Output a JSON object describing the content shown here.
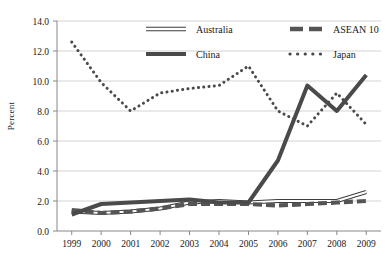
{
  "chart_data": {
    "type": "line",
    "title": "",
    "xlabel": "",
    "ylabel": "Percent",
    "x": [
      1999,
      2000,
      2001,
      2002,
      2003,
      2004,
      2005,
      2006,
      2007,
      2008,
      2009
    ],
    "categories": [
      "1999",
      "2000",
      "2001",
      "2002",
      "2003",
      "2004",
      "2005",
      "2006",
      "2007",
      "2008",
      "2009"
    ],
    "ylim": [
      0.0,
      14.0
    ],
    "yticks": [
      0.0,
      2.0,
      4.0,
      6.0,
      8.0,
      10.0,
      12.0,
      14.0
    ],
    "ytick_labels": [
      "0.0",
      "2.0",
      "4.0",
      "6.0",
      "8.0",
      "10.0",
      "12.0",
      "14.0"
    ],
    "grid": true,
    "legend_position": "top",
    "series": [
      {
        "name": "Australia",
        "style": "thin-outline",
        "color": "#3d3d3d",
        "values": [
          1.3,
          1.2,
          1.3,
          1.5,
          1.9,
          2.0,
          1.9,
          2.0,
          2.0,
          2.0,
          2.6
        ]
      },
      {
        "name": "ASEAN 10",
        "style": "dashed",
        "color": "#555555",
        "values": [
          1.4,
          1.2,
          1.3,
          1.5,
          1.8,
          1.8,
          1.8,
          1.7,
          1.8,
          1.9,
          2.0
        ]
      },
      {
        "name": "China",
        "style": "solid",
        "color": "#4a4a4a",
        "values": [
          1.1,
          1.8,
          1.9,
          2.0,
          2.1,
          1.9,
          1.9,
          4.7,
          9.7,
          8.0,
          10.4
        ]
      },
      {
        "name": "Japan",
        "style": "dotted",
        "color": "#4a4a4a",
        "values": [
          12.6,
          9.9,
          8.0,
          9.2,
          9.5,
          9.7,
          11.0,
          8.0,
          7.0,
          9.2,
          7.1
        ]
      }
    ]
  },
  "legend": {
    "items": [
      {
        "label": "Australia",
        "swatch": "outline-line-swatch"
      },
      {
        "label": "ASEAN 10",
        "swatch": "dashed-line-swatch"
      },
      {
        "label": "China",
        "swatch": "solid-line-swatch"
      },
      {
        "label": "Japan",
        "swatch": "dotted-line-swatch"
      }
    ]
  },
  "axes": {
    "y_title": "Percent"
  }
}
